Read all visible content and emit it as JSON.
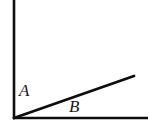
{
  "figure": {
    "kind": "angle-diagram",
    "background_color": "#FFFFFF",
    "stroke_color": "#0D0D0D",
    "label_color": "#1A1A1A",
    "canvas": {
      "width": 152,
      "height": 126
    },
    "vertex": {
      "x": 14,
      "y": 118
    },
    "rays": [
      {
        "name": "vertical-ray",
        "from": {
          "x": 14,
          "y": 118
        },
        "to": {
          "x": 14,
          "y": 0
        },
        "stroke_width": 2.6
      },
      {
        "name": "slanted-ray",
        "from": {
          "x": 14,
          "y": 118
        },
        "to": {
          "x": 134,
          "y": 76
        },
        "stroke_width": 2.8
      },
      {
        "name": "horizontal-ray",
        "from": {
          "x": 14,
          "y": 118
        },
        "to": {
          "x": 148,
          "y": 118
        },
        "stroke_width": 2.6
      }
    ],
    "labels": [
      {
        "id": "A",
        "text": "A",
        "style": "italic-serif",
        "font_size": 17,
        "position": {
          "x": 19,
          "y": 82
        },
        "describes": "angle between vertical ray and slanted ray"
      },
      {
        "id": "B",
        "text": "B",
        "style": "italic-serif",
        "font_size": 17,
        "position": {
          "x": 69,
          "y": 98
        },
        "describes": "angle between slanted ray and horizontal ray"
      }
    ]
  }
}
